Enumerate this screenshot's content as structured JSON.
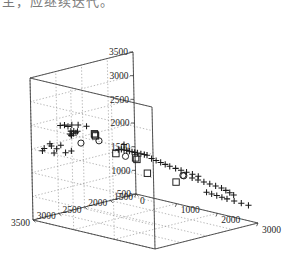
{
  "caption": {
    "text": "主，应继续迭代。"
  },
  "chart_data": {
    "type": "scatter",
    "projection": "3d",
    "title": "",
    "xlabel": "",
    "ylabel": "",
    "zlabel": "",
    "grid": true,
    "legend": "none",
    "colors": {
      "axis": "#3a3a3a",
      "grid": "#8c8c8c",
      "marker": "#1a1a1a",
      "background": "#ffffff"
    },
    "axes": {
      "x": {
        "label": "",
        "min": 0,
        "max": 3000,
        "step": 1000,
        "ticks": [
          "0",
          "1000",
          "2000",
          "3000"
        ]
      },
      "y": {
        "label": "",
        "min": 1500,
        "max": 3500,
        "step": 500,
        "ticks": [
          "1500",
          "2000",
          "2500",
          "3000",
          "3500"
        ]
      },
      "z": {
        "label": "",
        "min": 500,
        "max": 3500,
        "step": 500,
        "ticks": [
          "500",
          "1000",
          "1500",
          "2000",
          "2500",
          "3000",
          "3500"
        ]
      }
    },
    "series": [
      {
        "name": "plus",
        "marker": "plus",
        "count": 62,
        "points": [
          [
            250,
            3450,
            2050
          ],
          [
            330,
            3400,
            2150
          ],
          [
            340,
            3380,
            2100
          ],
          [
            180,
            3430,
            1980
          ],
          [
            430,
            3350,
            2050
          ],
          [
            470,
            3300,
            2120
          ],
          [
            300,
            3300,
            1920
          ],
          [
            520,
            3250,
            1960
          ],
          [
            600,
            3200,
            2000
          ],
          [
            620,
            3420,
            2600
          ],
          [
            700,
            3400,
            2620
          ],
          [
            760,
            3380,
            2600
          ],
          [
            830,
            3360,
            2640
          ],
          [
            960,
            3340,
            2660
          ],
          [
            890,
            3300,
            2500
          ],
          [
            700,
            3280,
            2460
          ],
          [
            760,
            3270,
            2470
          ],
          [
            800,
            3260,
            2440
          ],
          [
            640,
            3250,
            2380
          ],
          [
            660,
            3240,
            2360
          ],
          [
            700,
            3230,
            2400
          ],
          [
            620,
            3210,
            2330
          ],
          [
            1180,
            3350,
            2680
          ],
          [
            1250,
            2800,
            2050
          ],
          [
            1300,
            2780,
            2060
          ],
          [
            1340,
            2760,
            2050
          ],
          [
            1380,
            2740,
            2040
          ],
          [
            1420,
            2720,
            2030
          ],
          [
            1460,
            2700,
            2020
          ],
          [
            1500,
            2680,
            2010
          ],
          [
            1540,
            2660,
            2000
          ],
          [
            1600,
            2640,
            1990
          ],
          [
            1660,
            2620,
            1980
          ],
          [
            1700,
            2600,
            1970
          ],
          [
            1520,
            2900,
            2240
          ],
          [
            1760,
            2560,
            1900
          ],
          [
            1820,
            2520,
            1860
          ],
          [
            1880,
            2480,
            1820
          ],
          [
            1940,
            2440,
            1780
          ],
          [
            2000,
            2400,
            1740
          ],
          [
            2080,
            2350,
            1700
          ],
          [
            2150,
            2300,
            1660
          ],
          [
            2220,
            2250,
            1620
          ],
          [
            2300,
            2200,
            1580
          ],
          [
            2380,
            2150,
            1540
          ],
          [
            2100,
            2050,
            1420
          ],
          [
            2180,
            2000,
            1380
          ],
          [
            2260,
            1950,
            1340
          ],
          [
            2340,
            1900,
            1300
          ],
          [
            2420,
            1850,
            1260
          ],
          [
            2500,
            1800,
            1220
          ],
          [
            2580,
            1780,
            1180
          ],
          [
            2650,
            1760,
            1140
          ],
          [
            2720,
            1740,
            1100
          ],
          [
            2000,
            1700,
            1000
          ],
          [
            2100,
            1680,
            980
          ],
          [
            2200,
            1660,
            960
          ],
          [
            2300,
            1640,
            940
          ],
          [
            2400,
            1620,
            920
          ],
          [
            2550,
            1600,
            900
          ],
          [
            2700,
            1580,
            880
          ],
          [
            2850,
            1560,
            860
          ]
        ]
      },
      {
        "name": "square",
        "marker": "square",
        "count": 8,
        "points": [
          [
            1180,
            3200,
            2480
          ],
          [
            1180,
            3180,
            2430
          ],
          [
            1060,
            2700,
            1900
          ],
          [
            1480,
            2650,
            1880
          ],
          [
            1500,
            2640,
            1850
          ],
          [
            1060,
            2100,
            1320
          ],
          [
            1700,
            2050,
            1250
          ],
          [
            1180,
            3190,
            2455
          ]
        ]
      },
      {
        "name": "circle",
        "marker": "circle",
        "count": 5,
        "points": [
          [
            1160,
            3100,
            2300
          ],
          [
            1270,
            2680,
            1880
          ],
          [
            330,
            2800,
            2000
          ],
          [
            2000,
            2150,
            1480
          ],
          [
            2010,
            2140,
            1470
          ]
        ]
      }
    ]
  }
}
